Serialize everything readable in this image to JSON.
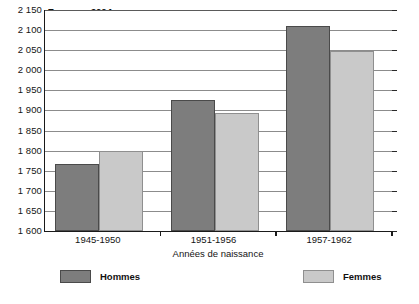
{
  "chart_data": {
    "type": "bar",
    "title": "",
    "unit_note": "En euros 2004",
    "xlabel": "Années de naissance",
    "ylabel": "",
    "categories": [
      "1945-1950",
      "1951-1956",
      "1957-1962"
    ],
    "series": [
      {
        "name": "Hommes",
        "color": "#7d7d7d",
        "values": [
          1768,
          1927,
          2110
        ]
      },
      {
        "name": "Femmes",
        "color": "#c9c9c9",
        "values": [
          1799,
          1893,
          2047
        ]
      }
    ],
    "ylim": [
      1600,
      2150
    ],
    "ytick_step": 50,
    "ytick_labels": [
      "2 150",
      "2 100",
      "2 050",
      "2 000",
      "1 950",
      "1 900",
      "1 850",
      "1 800",
      "1 750",
      "1 700",
      "1 650",
      "1 600"
    ],
    "ytick_values": [
      2150,
      2100,
      2050,
      2000,
      1950,
      1900,
      1850,
      1800,
      1750,
      1700,
      1650,
      1600
    ],
    "grid": true,
    "legend_position": "bottom",
    "legend": [
      {
        "label": "Hommes",
        "color": "#7d7d7d"
      },
      {
        "label": "Femmes",
        "color": "#c9c9c9"
      }
    ]
  }
}
